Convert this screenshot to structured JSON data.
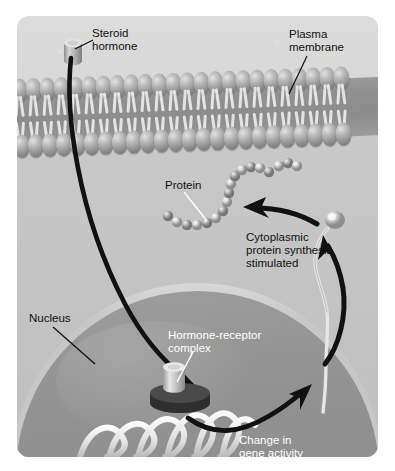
{
  "figure": {
    "panel_background": "#d4d4d4",
    "border_radius_px": 12
  },
  "labels": {
    "steroid_hormone": "Steroid\nhormone",
    "plasma_membrane": "Plasma\nmembrane",
    "protein": "Protein",
    "cytoplasmic_synthesis": "Cytoplasmic\nprotein synthesis\nstimulated",
    "nucleus": "Nucleus",
    "hormone_receptor_complex": "Hormone-receptor\ncomplex",
    "gene_activity": "Change in\ngene activity"
  },
  "label_colors": {
    "dark_text": "#111111",
    "light_text": "#ffffff"
  },
  "structures": {
    "membrane_name": "phospholipid-bilayer",
    "membrane_head_count": 24,
    "nucleus_name": "nucleus",
    "nucleus_fill": "#949494",
    "nuclear_envelope_fill": "#cfcfcf",
    "cytoplasm_fill": "#c4c4c4",
    "dna_name": "dna-helix",
    "dna_turns": 6,
    "protein_name": "protein-bead-chain",
    "protein_bead_count": 18,
    "mrna_name": "mrna-strand",
    "ribosome_name": "ribosome",
    "hormone_glyph": "steroid-cylinder",
    "receptor_glyph": "receptor-disc"
  },
  "arrows": {
    "hormone_entry": "hormone-entry-arrow",
    "gene_activity": "gene-activity-arrow",
    "protein_synthesis": "protein-synthesis-arrow",
    "mrna_export": "mrna-export-arrow",
    "color": "#111111"
  }
}
